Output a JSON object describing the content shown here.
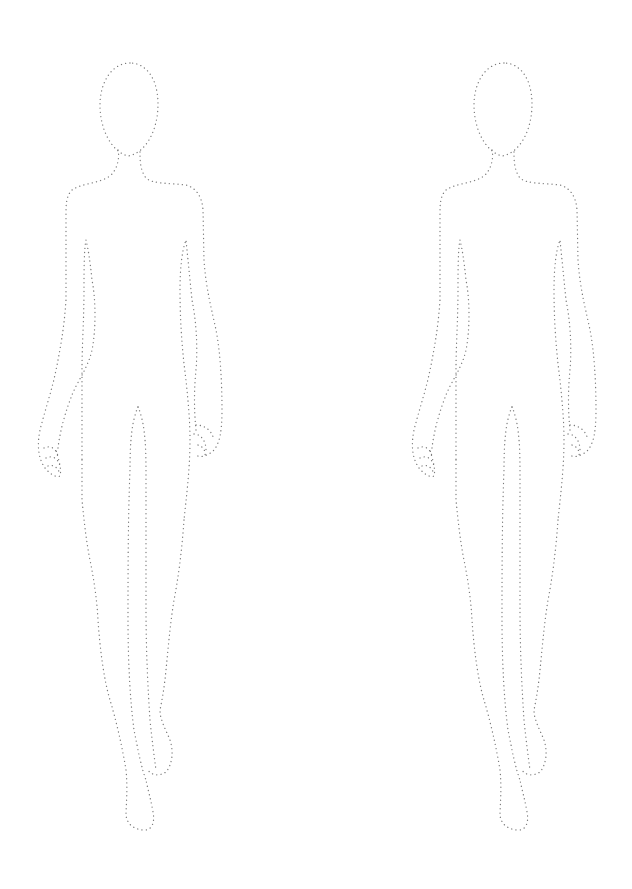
{
  "page": {
    "title": "Fashion croquis template",
    "background": "#ffffff",
    "dot_color": "#7a7a7a"
  },
  "figures": [
    {
      "label": "Croquis figure 1",
      "offset_x": 0,
      "offset_y": 0
    },
    {
      "label": "Croquis figure 2",
      "offset_x": 374,
      "offset_y": 0
    }
  ]
}
